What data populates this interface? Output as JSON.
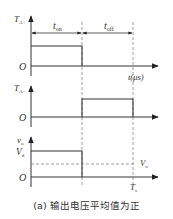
{
  "figure": {
    "caption": "(a) 输出电压平均值为正",
    "colors": {
      "line": "#333333",
      "dashed": "#888888",
      "background": "#ffffff"
    },
    "intervals": {
      "t_on_label": "t",
      "t_on_sub": "on",
      "t_off_label": "t",
      "t_off_sub": "off"
    },
    "panels": [
      {
        "id": "TA_plus",
        "y_label": "T",
        "y_sub": "A+",
        "origin_label": "O",
        "x_label": "t(μs)",
        "waveform": "high during t_on, low during t_off"
      },
      {
        "id": "TA_minus",
        "y_label": "T",
        "y_sub": "A−",
        "origin_label": "O",
        "waveform": "low during t_on, high during t_off"
      },
      {
        "id": "vo",
        "y_label": "v",
        "y_sub": "o",
        "level_label": "V",
        "level_sub": "d",
        "avg_label": "V",
        "avg_sub": "o",
        "origin_label": "O",
        "period_label": "T",
        "period_sub": "s",
        "waveform": "Vd during t_on, 0 during t_off; dashed average Vo"
      }
    ]
  }
}
